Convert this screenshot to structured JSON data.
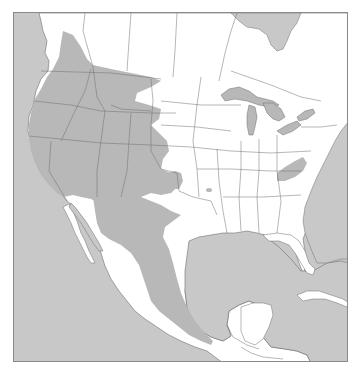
{
  "map": {
    "title": "",
    "region": "North America",
    "colors": {
      "water": "#c8c8c8",
      "land": "#ffffff",
      "range": "#b8b8b8",
      "boundary": "#6e6e6e",
      "frame": "#8a8a8a"
    },
    "layers": [
      {
        "name": "ocean",
        "label": ""
      },
      {
        "name": "land",
        "label": ""
      },
      {
        "name": "species-range",
        "label": ""
      },
      {
        "name": "state-boundaries",
        "label": ""
      },
      {
        "name": "lakes",
        "label": ""
      }
    ],
    "range_areas": [
      "western-range",
      "mexico-range",
      "appalachian-range",
      "arkansas-spot",
      "panhandle-lobe"
    ]
  }
}
